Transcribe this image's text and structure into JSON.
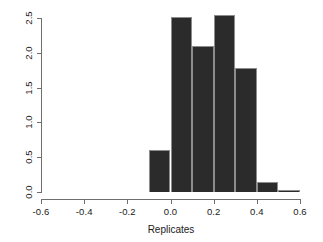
{
  "chart_data": {
    "type": "bar",
    "title": "",
    "subtitle": "",
    "xlabel": "Replicates",
    "ylabel": "",
    "xlim": [
      -0.6,
      0.6
    ],
    "ylim": [
      0.0,
      2.5
    ],
    "grid": false,
    "legend": null,
    "bin_width": 0.1,
    "bin_edges": [
      -0.1,
      0.0,
      0.1,
      0.2,
      0.3,
      0.4,
      0.5,
      0.6
    ],
    "categories": [
      "-0.1 to 0.0",
      "0.0 to 0.1",
      "0.1 to 0.2",
      "0.2 to 0.3",
      "0.3 to 0.4",
      "0.4 to 0.5",
      "0.5 to 0.6"
    ],
    "values": [
      0.6,
      2.52,
      2.1,
      2.55,
      1.78,
      0.15,
      0.03
    ],
    "bar_color": "#2b2b2b",
    "bar_border_color": "#8c8c8c",
    "axis_color": "#6e6e6e"
  },
  "axes": {
    "x": {
      "label": "Replicates",
      "ticks": [
        {
          "value": -0.6,
          "label": "-0.6"
        },
        {
          "value": -0.4,
          "label": "-0.4"
        },
        {
          "value": -0.2,
          "label": "-0.2"
        },
        {
          "value": 0.0,
          "label": "0.0"
        },
        {
          "value": 0.2,
          "label": "0.2"
        },
        {
          "value": 0.4,
          "label": "0.4"
        },
        {
          "value": 0.6,
          "label": "0.6"
        }
      ]
    },
    "y": {
      "label": "",
      "ticks": [
        {
          "value": 0.0,
          "label": "0.0"
        },
        {
          "value": 0.5,
          "label": "0.5"
        },
        {
          "value": 1.0,
          "label": "1.0"
        },
        {
          "value": 1.5,
          "label": "1.5"
        },
        {
          "value": 2.0,
          "label": "2.0"
        },
        {
          "value": 2.5,
          "label": "2.5"
        }
      ]
    }
  }
}
